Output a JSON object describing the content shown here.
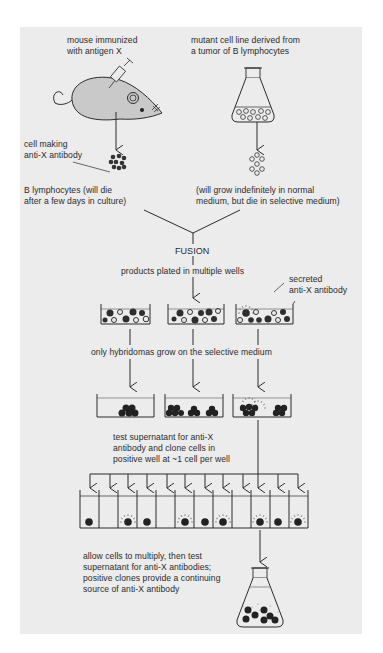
{
  "figure": {
    "colors": {
      "background": "#ececec",
      "ink": "#2b2b2b",
      "mouse_fill": "#c9c9c9",
      "cell_dark": "#2e2e2e"
    }
  },
  "sources": {
    "mouse": {
      "label_lines": [
        "mouse immunized",
        "with antigen X"
      ],
      "cell_label_lines": [
        "cell making",
        "anti-X antibody"
      ],
      "result_lines": [
        "B lymphocytes (will die",
        "after a few days in culture)"
      ]
    },
    "tumor": {
      "label_lines": [
        "mutant cell line derived from",
        "a tumor of B lymphocytes"
      ],
      "result_lines": [
        "(will grow indefinitely in normal",
        "medium, but die in selective medium)"
      ]
    }
  },
  "steps": {
    "fusion": "FUSION",
    "plating": "products plated in multiple wells",
    "secreted_label_lines": [
      "secreted",
      "anti-X antibody"
    ],
    "selection": "only hybridomas grow on the selective medium",
    "test_clone_lines": [
      "test supernatant for anti-X",
      "antibody and clone cells in",
      "positive well at ~1 cell per well"
    ],
    "final_lines": [
      "allow cells to multiply, then test",
      "supernatant for anti-X antibodies;",
      "positive clones provide a continuing",
      "source of anti-X antibody"
    ]
  },
  "wells": {
    "initial_plates": 3,
    "selected_plates": 3,
    "clone_wells": 12,
    "clone_wells_with_cell": [
      1,
      3,
      4,
      6,
      7,
      8,
      10,
      11,
      12
    ],
    "clone_wells_secreting": [
      3,
      6,
      8,
      10,
      12
    ]
  }
}
